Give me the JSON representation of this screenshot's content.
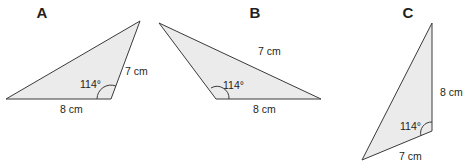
{
  "triangles": [
    {
      "id": "A",
      "title": "A",
      "angle_label": "114°",
      "side_labels": {
        "base": "8 cm",
        "side": "7 cm"
      },
      "vertices": [
        [
          6,
          99
        ],
        [
          140,
          21
        ],
        [
          111,
          99
        ]
      ]
    },
    {
      "id": "B",
      "title": "B",
      "angle_label": "114°",
      "side_labels": {
        "base": "8 cm",
        "side": "7 cm"
      },
      "vertices": [
        [
          159,
          23
        ],
        [
          216,
          99
        ],
        [
          321,
          99
        ]
      ]
    },
    {
      "id": "C",
      "title": "C",
      "angle_label": "114°",
      "side_labels": {
        "vertical": "8 cm",
        "bottom": "7 cm"
      },
      "vertices": [
        [
          432,
          23
        ],
        [
          432,
          131
        ],
        [
          362,
          160
        ]
      ]
    }
  ],
  "colors": {
    "fill": "#ebebeb",
    "stroke": "#3a3a3a",
    "text": "#231f20"
  }
}
